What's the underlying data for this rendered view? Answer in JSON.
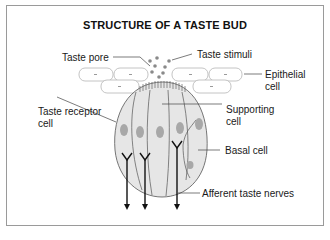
{
  "title": "STRUCTURE OF A TASTE BUD",
  "labels": {
    "taste_pore": "Taste pore",
    "taste_stimuli": "Taste stimuli",
    "epithelial_line1": "Epithelial",
    "epithelial_line2": "cell",
    "taste_receptor_line1": "Taste receptor",
    "taste_receptor_line2": "cell",
    "supporting_line1": "Supporting",
    "supporting_line2": "cell",
    "basal_cell": "Basal cell",
    "afferent_nerves": "Afferent taste nerves"
  },
  "colors": {
    "bud_fill": "#e6e6e6",
    "nucleus": "#a8a8a8",
    "outline": "#555555",
    "frame": "#9a9a9a",
    "stimuli_dots": "#8a8a8a"
  }
}
